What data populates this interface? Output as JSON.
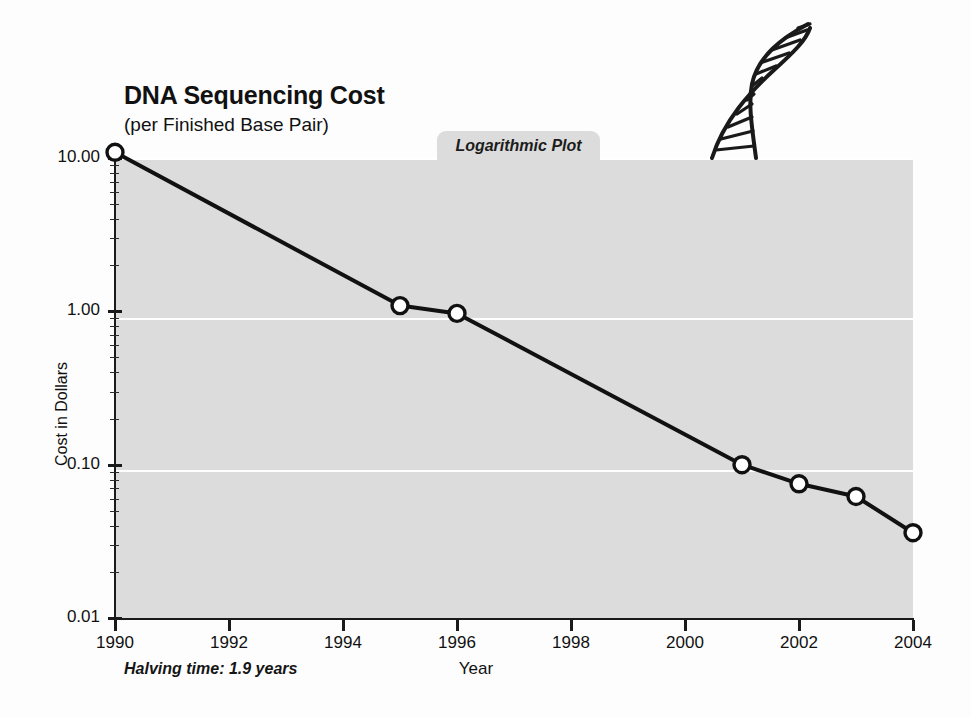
{
  "chart_data": {
    "type": "line",
    "title": "DNA Sequencing Cost",
    "subtitle": "(per Finished Base Pair)",
    "plot_type_label": "Logarithmic Plot",
    "xlabel": "Year",
    "ylabel": "Cost in Dollars",
    "annotation": "Halving time: 1.9 years",
    "yscale": "log",
    "ylim": [
      0.01,
      10.0
    ],
    "xlim": [
      1990,
      2004
    ],
    "grid": true,
    "legend": "none",
    "y_tick_labels": [
      "10.00",
      "1.00",
      "0.10",
      "0.01"
    ],
    "y_tick_values": [
      10.0,
      1.0,
      0.1,
      0.01
    ],
    "x_tick_labels": [
      "1990",
      "1992",
      "1994",
      "1996",
      "1998",
      "2000",
      "2002",
      "2004"
    ],
    "x_tick_values": [
      1990,
      1992,
      1994,
      1996,
      1998,
      2000,
      2002,
      2004
    ],
    "series": [
      {
        "name": "DNA sequencing cost per finished base pair",
        "x": [
          1990,
          1995,
          1996,
          2001,
          2002,
          2003,
          2004
        ],
        "values": [
          10.9,
          1.09,
          0.97,
          0.1,
          0.075,
          0.062,
          0.036
        ]
      }
    ],
    "colors": {
      "plot_background": "#dcdcdc",
      "page_background": "#fdfdfd",
      "line": "#111111",
      "marker_fill": "#ffffff",
      "gridline": "#ffffff",
      "axis": "#1a1a1a"
    },
    "decoration": "dna-double-helix"
  }
}
